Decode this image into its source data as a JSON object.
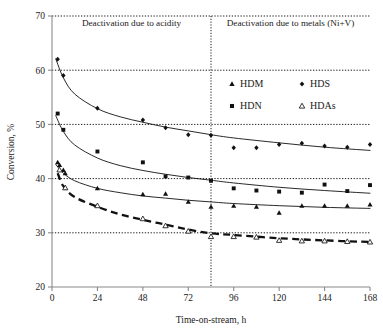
{
  "chart_data": {
    "type": "scatter",
    "title": "",
    "subtitle": "",
    "xlabel": "Time-on-stream, h",
    "ylabel": "Conversion, %",
    "xlim": [
      0,
      168
    ],
    "ylim": [
      20,
      70
    ],
    "xticks": [
      0,
      24,
      48,
      72,
      96,
      120,
      144,
      168
    ],
    "yticks": [
      20,
      30,
      40,
      50,
      60,
      70
    ],
    "grid": "horizontal-dotted at y = 30, 40, 50, 60, 70",
    "legend_position": "upper-right-inside",
    "annotations": [
      {
        "text": "Deactivation due to acidity",
        "x": 42,
        "y": 68.2,
        "align": "center"
      },
      {
        "text": "Deactivation due to metals (Ni+V)",
        "x": 126,
        "y": 68.2,
        "align": "center"
      },
      {
        "type": "vertical-divider",
        "x": 84,
        "style": "dotted"
      }
    ],
    "series": [
      {
        "name": "HDM",
        "marker": "filled-triangle",
        "fit_line": "solid",
        "points": [
          {
            "x": 3,
            "y": 43.0
          },
          {
            "x": 4,
            "y": 42.5
          },
          {
            "x": 6,
            "y": 41.6
          },
          {
            "x": 7,
            "y": 41.0
          },
          {
            "x": 24,
            "y": 38.2
          },
          {
            "x": 48,
            "y": 37.1
          },
          {
            "x": 60,
            "y": 37.2
          },
          {
            "x": 72,
            "y": 35.7
          },
          {
            "x": 84,
            "y": 34.8
          },
          {
            "x": 96,
            "y": 35.0
          },
          {
            "x": 108,
            "y": 34.8
          },
          {
            "x": 120,
            "y": 33.7
          },
          {
            "x": 132,
            "y": 35.0
          },
          {
            "x": 144,
            "y": 35.0
          },
          {
            "x": 156,
            "y": 35.0
          },
          {
            "x": 168,
            "y": 35.2
          }
        ],
        "fit_values": [
          {
            "x": 2,
            "y": 42.6
          },
          {
            "x": 6,
            "y": 41.0
          },
          {
            "x": 12,
            "y": 39.6
          },
          {
            "x": 24,
            "y": 38.2
          },
          {
            "x": 36,
            "y": 37.4
          },
          {
            "x": 48,
            "y": 36.8
          },
          {
            "x": 60,
            "y": 36.4
          },
          {
            "x": 72,
            "y": 36.0
          },
          {
            "x": 84,
            "y": 35.7
          },
          {
            "x": 96,
            "y": 35.4
          },
          {
            "x": 120,
            "y": 35.0
          },
          {
            "x": 144,
            "y": 34.7
          },
          {
            "x": 168,
            "y": 34.5
          }
        ]
      },
      {
        "name": "HDS",
        "marker": "filled-diamond",
        "fit_line": "solid",
        "points": [
          {
            "x": 3,
            "y": 62.0
          },
          {
            "x": 6,
            "y": 59.0
          },
          {
            "x": 24,
            "y": 53.0
          },
          {
            "x": 48,
            "y": 50.8
          },
          {
            "x": 60,
            "y": 49.4
          },
          {
            "x": 72,
            "y": 48.1
          },
          {
            "x": 84,
            "y": 48.0
          },
          {
            "x": 96,
            "y": 45.7
          },
          {
            "x": 108,
            "y": 45.7
          },
          {
            "x": 120,
            "y": 46.3
          },
          {
            "x": 132,
            "y": 46.5
          },
          {
            "x": 144,
            "y": 46.0
          },
          {
            "x": 156,
            "y": 45.8
          },
          {
            "x": 168,
            "y": 46.3
          }
        ],
        "fit_values": [
          {
            "x": 2,
            "y": 62.1
          },
          {
            "x": 6,
            "y": 58.6
          },
          {
            "x": 12,
            "y": 55.6
          },
          {
            "x": 24,
            "y": 52.9
          },
          {
            "x": 36,
            "y": 51.4
          },
          {
            "x": 48,
            "y": 50.4
          },
          {
            "x": 60,
            "y": 49.5
          },
          {
            "x": 72,
            "y": 48.8
          },
          {
            "x": 84,
            "y": 48.1
          },
          {
            "x": 96,
            "y": 47.5
          },
          {
            "x": 120,
            "y": 46.6
          },
          {
            "x": 144,
            "y": 45.8
          },
          {
            "x": 168,
            "y": 45.2
          }
        ]
      },
      {
        "name": "HDN",
        "marker": "filled-square",
        "fit_line": "solid",
        "points": [
          {
            "x": 3,
            "y": 52.0
          },
          {
            "x": 6,
            "y": 49.0
          },
          {
            "x": 24,
            "y": 45.0
          },
          {
            "x": 48,
            "y": 43.0
          },
          {
            "x": 60,
            "y": 40.4
          },
          {
            "x": 72,
            "y": 40.2
          },
          {
            "x": 84,
            "y": 39.6
          },
          {
            "x": 96,
            "y": 38.2
          },
          {
            "x": 108,
            "y": 37.8
          },
          {
            "x": 120,
            "y": 37.6
          },
          {
            "x": 132,
            "y": 37.4
          },
          {
            "x": 144,
            "y": 38.9
          },
          {
            "x": 156,
            "y": 37.7
          },
          {
            "x": 168,
            "y": 38.8
          }
        ],
        "fit_values": [
          {
            "x": 2,
            "y": 51.6
          },
          {
            "x": 6,
            "y": 48.7
          },
          {
            "x": 12,
            "y": 46.2
          },
          {
            "x": 24,
            "y": 43.8
          },
          {
            "x": 36,
            "y": 42.4
          },
          {
            "x": 48,
            "y": 41.5
          },
          {
            "x": 60,
            "y": 40.8
          },
          {
            "x": 72,
            "y": 40.2
          },
          {
            "x": 84,
            "y": 39.7
          },
          {
            "x": 96,
            "y": 39.2
          },
          {
            "x": 120,
            "y": 38.4
          },
          {
            "x": 144,
            "y": 37.8
          },
          {
            "x": 168,
            "y": 37.3
          }
        ]
      },
      {
        "name": "HDAs",
        "marker": "open-triangle",
        "fit_line": "dashed",
        "points": [
          {
            "x": 4,
            "y": 41.6
          },
          {
            "x": 7,
            "y": 38.3
          },
          {
            "x": 24,
            "y": 35.0
          },
          {
            "x": 48,
            "y": 32.6
          },
          {
            "x": 60,
            "y": 31.3
          },
          {
            "x": 72,
            "y": 30.3
          },
          {
            "x": 84,
            "y": 29.3
          },
          {
            "x": 96,
            "y": 29.3
          },
          {
            "x": 108,
            "y": 29.2
          },
          {
            "x": 120,
            "y": 28.6
          },
          {
            "x": 132,
            "y": 28.5
          },
          {
            "x": 144,
            "y": 28.5
          },
          {
            "x": 156,
            "y": 28.4
          },
          {
            "x": 168,
            "y": 28.3
          }
        ],
        "fit_values": [
          {
            "x": 3,
            "y": 41.0
          },
          {
            "x": 6,
            "y": 38.6
          },
          {
            "x": 12,
            "y": 36.6
          },
          {
            "x": 24,
            "y": 34.8
          },
          {
            "x": 36,
            "y": 33.4
          },
          {
            "x": 48,
            "y": 32.4
          },
          {
            "x": 60,
            "y": 31.5
          },
          {
            "x": 72,
            "y": 30.6
          },
          {
            "x": 84,
            "y": 29.9
          },
          {
            "x": 96,
            "y": 29.6
          },
          {
            "x": 120,
            "y": 29.0
          },
          {
            "x": 144,
            "y": 28.6
          },
          {
            "x": 168,
            "y": 28.3
          }
        ]
      }
    ],
    "legend": [
      {
        "label": "HDM",
        "marker": "filled-triangle"
      },
      {
        "label": "HDS",
        "marker": "filled-diamond"
      },
      {
        "label": "HDN",
        "marker": "filled-square"
      },
      {
        "label": "HDAs",
        "marker": "open-triangle"
      }
    ]
  },
  "axes": {
    "y_title": "Conversion, %",
    "x_title": "Time-on-stream, h",
    "y_tick_labels": [
      "70",
      "60",
      "50",
      "40",
      "30",
      "20"
    ],
    "x_tick_labels": [
      "0",
      "24",
      "48",
      "72",
      "96",
      "120",
      "144",
      "168"
    ]
  },
  "regions": {
    "left_label": "Deactivation due to acidity",
    "right_label": "Deactivation due to metals (Ni+V)"
  },
  "legend": {
    "items": [
      {
        "label": "HDM"
      },
      {
        "label": "HDS"
      },
      {
        "label": "HDN"
      },
      {
        "label": "HDAs"
      }
    ]
  },
  "colors": {
    "ink": "#1a1a1a",
    "axis": "#808080",
    "grid": "#000000",
    "background": "#ffffff"
  }
}
